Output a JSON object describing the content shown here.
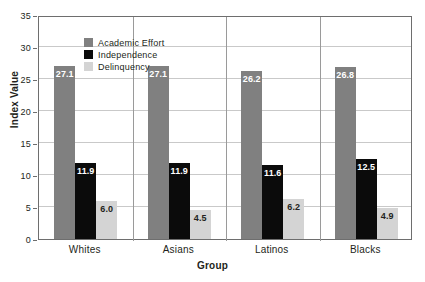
{
  "chart_data": {
    "type": "bar",
    "title": "",
    "xlabel": "Group",
    "ylabel": "Index Value",
    "ylim": [
      0,
      35
    ],
    "yticks": [
      0,
      5,
      10,
      15,
      20,
      25,
      30,
      35
    ],
    "grid": true,
    "legend_position": "top-left inside plot",
    "categories": [
      "Whites",
      "Asians",
      "Latinos",
      "Blacks"
    ],
    "series": [
      {
        "name": "Academic Effort",
        "color": "#808080",
        "values": [
          27.1,
          27.1,
          26.2,
          26.8
        ],
        "labels": [
          "27.1",
          "27.1",
          "26.2",
          "26.8"
        ]
      },
      {
        "name": "Independence",
        "color": "#0b0b0b",
        "values": [
          11.9,
          11.9,
          11.6,
          12.5
        ],
        "labels": [
          "11.9",
          "11.9",
          "11.6",
          "12.5"
        ]
      },
      {
        "name": "Delinquency",
        "color": "#d4d4d4",
        "values": [
          6.0,
          4.5,
          6.2,
          4.9
        ],
        "labels": [
          "6.0",
          "4.5",
          "6.2",
          "4.9"
        ]
      }
    ]
  },
  "axis": {
    "y_title": "Index Value",
    "x_title": "Group",
    "y_tick_labels": [
      "0",
      "5",
      "10",
      "15",
      "20",
      "25",
      "30",
      "35"
    ]
  },
  "legend": {
    "items": [
      {
        "label": "Academic Effort"
      },
      {
        "label": "Independence"
      },
      {
        "label": "Delinquency"
      }
    ]
  }
}
